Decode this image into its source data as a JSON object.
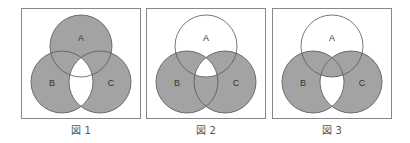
{
  "shade_color": "#a3a3a3",
  "figures": [
    {
      "caption": "図 1",
      "labels": {
        "a": "A",
        "b": "B",
        "c": "C"
      },
      "shaded_regions": [
        "A only",
        "B only",
        "C only",
        "A∩B only",
        "A∩C only"
      ],
      "white_regions": [
        "B∩C (including A∩B∩C)"
      ]
    },
    {
      "caption": "図 2",
      "labels": {
        "a": "A",
        "b": "B",
        "c": "C"
      },
      "shaded_regions": [
        "B only",
        "C only",
        "A∩B only",
        "A∩C only",
        "B∩C only"
      ],
      "white_regions": [
        "A only",
        "A∩B∩C"
      ]
    },
    {
      "caption": "図 3",
      "labels": {
        "a": "A",
        "b": "B",
        "c": "C"
      },
      "shaded_regions": [
        "B only",
        "C only",
        "A∩B only",
        "A∩C only",
        "A∩B∩C"
      ],
      "white_regions": [
        "A only",
        "B∩C only"
      ]
    }
  ]
}
